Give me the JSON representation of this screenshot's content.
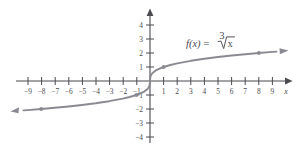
{
  "figure": {
    "function_label_prefix": "f",
    "function_label_args": "(x)",
    "function_label_equals": "=",
    "radical_index": "3",
    "radical_radicand": "x",
    "function_label_plain": "f(x) = cube root of x",
    "axis_x_name": "x",
    "curve_color": "#8a8a92",
    "axis_color": "#4a4a50",
    "point_color": "#8a8a92",
    "text_color": "#4a4a50",
    "background_color": "#ffffff"
  },
  "chart_data": {
    "type": "line",
    "title": "",
    "subtitle": "",
    "xlabel": "x",
    "ylabel": "",
    "function": "f(x) = x^(1/3)",
    "legend": [
      "f(x) = ∛x"
    ],
    "legend_position": "upper-right-inside",
    "grid": false,
    "xlim": [
      -9.8,
      9.8
    ],
    "ylim": [
      -4.6,
      4.6
    ],
    "xticks": [
      -9,
      -8,
      -7,
      -6,
      -5,
      -4,
      -3,
      -2,
      -1,
      1,
      2,
      3,
      4,
      5,
      6,
      7,
      8,
      9
    ],
    "xtick_labels": [
      "-9",
      "-8",
      "-7",
      "-6",
      "-5",
      "-4",
      "-3",
      "-2",
      "-1",
      "1",
      "2",
      "3",
      "4",
      "5",
      "6",
      "7",
      "8",
      "9"
    ],
    "yticks": [
      -4,
      -3,
      -2,
      -1,
      1,
      2,
      3,
      4
    ],
    "ytick_labels": [
      "-4",
      "-3",
      "-2",
      "-1",
      "1",
      "2",
      "3",
      "4"
    ],
    "marked_points": [
      {
        "x": -8,
        "y": -2
      },
      {
        "x": -1,
        "y": -1
      },
      {
        "x": 1,
        "y": 1
      },
      {
        "x": 8,
        "y": 2
      }
    ],
    "x": [
      -9.3,
      -9,
      -8,
      -7,
      -6,
      -5,
      -4,
      -3,
      -2,
      -1.5,
      -1,
      -0.7,
      -0.4,
      -0.2,
      -0.1,
      -0.03,
      0,
      0.03,
      0.1,
      0.2,
      0.4,
      0.7,
      1,
      1.5,
      2,
      3,
      4,
      5,
      6,
      7,
      8,
      9,
      9.3
    ],
    "values": [
      -2.1,
      -2.08,
      -2,
      -1.913,
      -1.817,
      -1.71,
      -1.587,
      -1.442,
      -1.26,
      -1.145,
      -1,
      -0.888,
      -0.737,
      -0.585,
      -0.464,
      -0.311,
      0,
      0.311,
      0.464,
      0.585,
      0.737,
      0.888,
      1,
      1.145,
      1.26,
      1.442,
      1.587,
      1.71,
      1.817,
      1.913,
      2,
      2.08,
      2.1
    ],
    "arrow_ends": [
      "left",
      "right"
    ],
    "axis_arrows": [
      "x-right",
      "y-up"
    ]
  }
}
